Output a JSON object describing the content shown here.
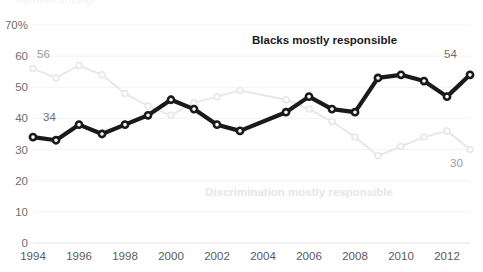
{
  "figure": {
    "cut_off_title": "opinion among",
    "y_axis_top_label": "70%"
  },
  "chart_data": {
    "type": "line",
    "title": "",
    "subtitle": "",
    "xlabel": "",
    "ylabel": "",
    "ylim": [
      0,
      70
    ],
    "xlim": [
      1994,
      2013
    ],
    "grid": true,
    "legend_position": "inline-annotation",
    "y_ticks": [
      "0",
      "10",
      "20",
      "30",
      "40",
      "50",
      "60",
      "70%"
    ],
    "y_tick_values": [
      0,
      10,
      20,
      30,
      40,
      50,
      60,
      70
    ],
    "x_ticks": [
      "1994",
      "1996",
      "1998",
      "2000",
      "2002",
      "2004",
      "2006",
      "2008",
      "2010",
      "2012"
    ],
    "x_tick_values": [
      1994,
      1996,
      1998,
      2000,
      2002,
      2004,
      2006,
      2008,
      2010,
      2012
    ],
    "series": [
      {
        "name": "Blacks mostly responsible",
        "color": "#1a1a1a",
        "label_position": {
          "x": 252,
          "y": 44
        },
        "endpoint_labels": [
          {
            "text": "34",
            "x": 43,
            "y": 121
          },
          {
            "text": "54",
            "x": 444,
            "y": 58
          }
        ],
        "x": [
          1994,
          1995,
          1996,
          1997,
          1998,
          1999,
          2000,
          2001,
          2003,
          2005,
          2006,
          2007,
          2008,
          2009,
          2011,
          2012
        ],
        "values": [
          34,
          33,
          38,
          35,
          38,
          41,
          46,
          43,
          38,
          36,
          42,
          47,
          43,
          42,
          53,
          54
        ],
        "points": [
          {
            "x": 1994,
            "y": 34
          },
          {
            "x": 1995,
            "y": 33
          },
          {
            "x": 1996,
            "y": 38
          },
          {
            "x": 1997,
            "y": 35
          },
          {
            "x": 1998,
            "y": 38
          },
          {
            "x": 1999,
            "y": 41
          },
          {
            "x": 2000,
            "y": 46
          },
          {
            "x": 2001,
            "y": 43
          },
          {
            "x": 2002,
            "y": 38
          },
          {
            "x": 2003,
            "y": 36
          },
          {
            "x": 2005,
            "y": 42
          },
          {
            "x": 2006,
            "y": 47
          },
          {
            "x": 2007,
            "y": 43
          },
          {
            "x": 2008,
            "y": 42
          },
          {
            "x": 2009,
            "y": 53
          },
          {
            "x": 2010,
            "y": 54
          },
          {
            "x": 2011,
            "y": 52
          },
          {
            "x": 2012,
            "y": 47
          },
          {
            "x": 2013,
            "y": 54
          }
        ]
      },
      {
        "name": "Discrimination mostly responsible",
        "color": "#e8e8ea",
        "label_position": {
          "x": 205,
          "y": 196
        },
        "endpoint_labels": [
          {
            "text": "56",
            "x": 37,
            "y": 58
          },
          {
            "text": "30",
            "x": 450,
            "y": 167
          }
        ],
        "x": [
          1994,
          1995,
          1996,
          1997,
          1998,
          1999,
          2000,
          2001,
          2003,
          2005,
          2006,
          2007,
          2008,
          2009,
          2011,
          2012
        ],
        "values": [
          56,
          53,
          57,
          54,
          48,
          44,
          41,
          45,
          47,
          49,
          44,
          38,
          34,
          30,
          36,
          30
        ],
        "points": [
          {
            "x": 1994,
            "y": 56
          },
          {
            "x": 1995,
            "y": 53
          },
          {
            "x": 1996,
            "y": 57
          },
          {
            "x": 1997,
            "y": 54
          },
          {
            "x": 1998,
            "y": 48
          },
          {
            "x": 1999,
            "y": 44
          },
          {
            "x": 2000,
            "y": 41
          },
          {
            "x": 2001,
            "y": 45
          },
          {
            "x": 2002,
            "y": 47
          },
          {
            "x": 2003,
            "y": 49
          },
          {
            "x": 2005,
            "y": 46
          },
          {
            "x": 2006,
            "y": 43
          },
          {
            "x": 2007,
            "y": 39
          },
          {
            "x": 2008,
            "y": 34
          },
          {
            "x": 2009,
            "y": 28
          },
          {
            "x": 2010,
            "y": 31
          },
          {
            "x": 2011,
            "y": 34
          },
          {
            "x": 2012,
            "y": 36
          },
          {
            "x": 2013,
            "y": 30
          }
        ]
      }
    ]
  }
}
